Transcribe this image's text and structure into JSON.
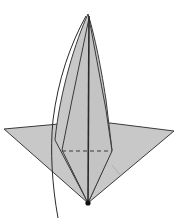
{
  "diagram": {
    "type": "origami-fold-diagram",
    "colors": {
      "paper": "#c8c8c8",
      "line": "#3a3a3a",
      "background": "#ffffff"
    },
    "elements": [
      "outer-diamond",
      "tall-point",
      "inner-kite",
      "center-crease",
      "valley-fold-dashed",
      "curved-arrow",
      "bottom-dot"
    ]
  }
}
